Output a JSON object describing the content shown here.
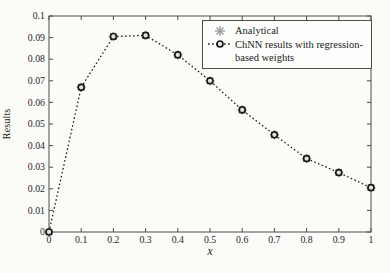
{
  "figure": {
    "background": "#fbfbf8",
    "axis_color": "#4d4d4d",
    "text_color": "#262626"
  },
  "chart_data": {
    "type": "line",
    "title": "",
    "xlabel": "x",
    "ylabel": "Results",
    "xlim": [
      0,
      1
    ],
    "ylim": [
      0,
      0.1
    ],
    "grid": false,
    "legend_position": "top-right-inside",
    "x_ticks": [
      "0",
      "0.1",
      "0.2",
      "0.3",
      "0.4",
      "0.5",
      "0.6",
      "0.7",
      "0.8",
      "0.9",
      "1"
    ],
    "y_ticks": [
      "0",
      "0.01",
      "0.02",
      "0.03",
      "0.04",
      "0.05",
      "0.06",
      "0.07",
      "0.08",
      "0.09",
      "0.1"
    ],
    "x": [
      0,
      0.1,
      0.2,
      0.3,
      0.4,
      0.5,
      0.6,
      0.7,
      0.8,
      0.9,
      1
    ],
    "series": [
      {
        "name": "Analytical",
        "marker": "asterisk",
        "marker_color": "#9c9c9c",
        "line": "none",
        "values": [
          0,
          0.067,
          0.0905,
          0.091,
          0.082,
          0.07,
          0.0565,
          0.045,
          0.034,
          0.0275,
          0.0205
        ]
      },
      {
        "name": "ChNN results with regression-based weights",
        "marker": "circle",
        "marker_color": "#1a1a1a",
        "line": "dotted",
        "line_color": "#1a1a1a",
        "values": [
          0,
          0.067,
          0.0905,
          0.091,
          0.082,
          0.07,
          0.0565,
          0.045,
          0.034,
          0.0275,
          0.0205
        ]
      }
    ],
    "legend": {
      "row1": "Analytical",
      "row2": "ChNN results with regression-",
      "row3": "based weights"
    }
  }
}
